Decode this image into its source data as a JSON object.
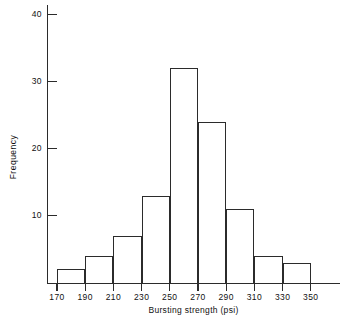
{
  "chart_data": {
    "type": "bar",
    "title": "",
    "subtitle": "",
    "xlabel": "Bursting strength  (psi)",
    "ylabel": "Frequency",
    "bin_width": 20,
    "bin_edges": [
      170,
      190,
      210,
      230,
      250,
      270,
      290,
      310,
      330,
      350
    ],
    "categories": [
      "170-190",
      "190-210",
      "210-230",
      "230-250",
      "250-270",
      "270-290",
      "290-310",
      "310-330",
      "330-350"
    ],
    "values": [
      2,
      4,
      7,
      13,
      32,
      24,
      11,
      4,
      3
    ],
    "x_tick_labels": [
      "170",
      "190",
      "210",
      "230",
      "250",
      "270",
      "290",
      "310",
      "330",
      "350"
    ],
    "x_tick_values": [
      170,
      190,
      210,
      230,
      250,
      270,
      290,
      310,
      330,
      350
    ],
    "y_tick_labels": [
      "10",
      "20",
      "30",
      "40"
    ],
    "y_tick_values": [
      10,
      20,
      30,
      40
    ],
    "xlim": [
      150,
      360
    ],
    "ylim": [
      0,
      45
    ],
    "grid": false,
    "legend": null,
    "bar_fill_color": "#ffffff",
    "bar_edge_color": "#2b2b2b",
    "axis_color": "#2b2b2b",
    "background_color": "#ffffff"
  }
}
